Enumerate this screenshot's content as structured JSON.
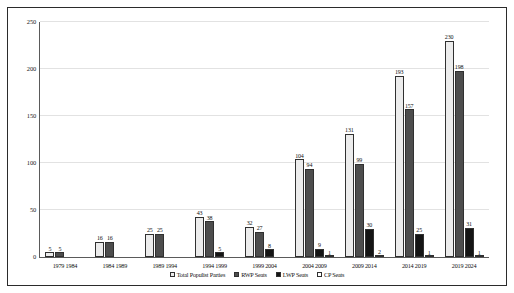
{
  "chart_data": {
    "type": "bar",
    "title": "",
    "xlabel": "",
    "ylabel": "",
    "ylim": [
      0,
      250
    ],
    "yticks": [
      0,
      50,
      100,
      150,
      200,
      250
    ],
    "grid": true,
    "legend_position": "bottom",
    "categories": [
      "1979-1984",
      "1984-1989",
      "1989-1994",
      "1994-1999",
      "1999-2004",
      "2004-2009",
      "2009-2014",
      "2014-2019",
      "2019-2024"
    ],
    "series": [
      {
        "name": "Total Populist Parties",
        "values": [
          5,
          16,
          25,
          43,
          32,
          104,
          131,
          193,
          230
        ]
      },
      {
        "name": "RWP Seats",
        "values": [
          5,
          16,
          25,
          38,
          27,
          94,
          99,
          157,
          198
        ]
      },
      {
        "name": "LWP Seats",
        "values": [
          null,
          null,
          null,
          5,
          8,
          9,
          30,
          25,
          31
        ]
      },
      {
        "name": "CP Seats",
        "values": [
          null,
          null,
          null,
          null,
          null,
          1,
          2,
          1,
          1
        ]
      }
    ]
  },
  "legend": {
    "items": [
      {
        "label": "Total Populist Parties",
        "swatch": "light-gray-swatch"
      },
      {
        "label": "RWP Seats",
        "swatch": "dark-gray-swatch"
      },
      {
        "label": "LWP Seats",
        "swatch": "black-swatch"
      },
      {
        "label": "CP Seats",
        "swatch": "white-swatch"
      }
    ]
  },
  "colors": {
    "series_1": "#ececec",
    "series_2": "#4d4d4d",
    "series_3": "#151515",
    "series_4": "#000000",
    "grid": "#e2e2e2",
    "axis": "#5a5a5a",
    "border": "#2b2b2b"
  }
}
